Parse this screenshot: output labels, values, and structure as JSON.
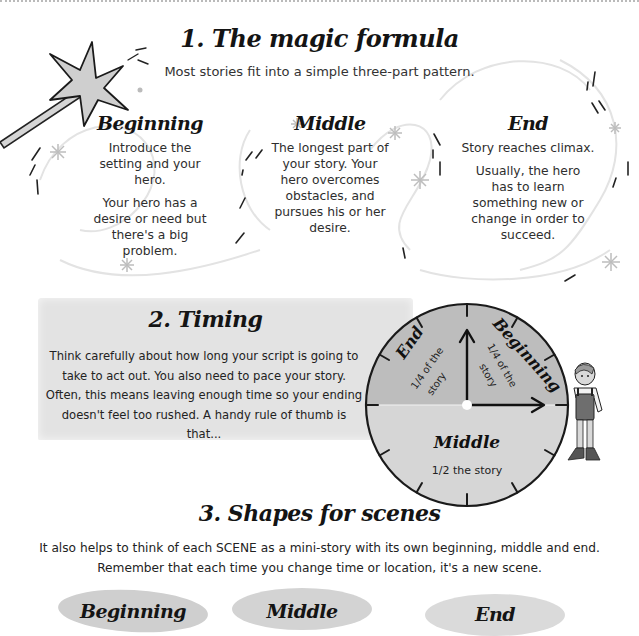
{
  "section1": {
    "title": "1. The magic formula",
    "subtitle": "Most stories fit into a simple three-part pattern.",
    "columns": [
      {
        "title": "Beginning",
        "paragraphs": [
          "Introduce the setting and your hero.",
          "Your hero has a desire or need but there's a big problem."
        ]
      },
      {
        "title": "Middle",
        "paragraphs": [
          "The longest part of your story. Your hero overcomes obstacles, and pursues his or her desire."
        ]
      },
      {
        "title": "End",
        "paragraphs": [
          "Story reaches climax.",
          "Usually, the hero has to learn something new or change in order to succeed."
        ]
      }
    ]
  },
  "section2": {
    "title": "2. Timing",
    "body": "Think carefully about how long your script is going to take to act out. You also need to pace your story. Often, this means leaving enough time so your ending doesn't feel too rushed. A handy rule of thumb is that...",
    "clock": {
      "segments": [
        {
          "label": "Beginning",
          "portion": "1/4 of the story",
          "fraction": 0.25
        },
        {
          "label": "Middle",
          "portion": "1/2 the story",
          "fraction": 0.5
        },
        {
          "label": "End",
          "portion": "1/4 of the story",
          "fraction": 0.25
        }
      ],
      "colors": {
        "quarters": "#bcbcbc",
        "half": "#d6d6d6",
        "outline": "#1a1a1a"
      }
    }
  },
  "section3": {
    "title": "3. Shapes for scenes",
    "body_line1": "It also helps to think of each SCENE as a mini-story with its own beginning, middle and end.",
    "body_line2": "Remember that each time you change time or location, it's a new scene.",
    "shapes": [
      {
        "label": "Beginning"
      },
      {
        "label": "Middle"
      },
      {
        "label": "End"
      }
    ]
  },
  "icons": {
    "wand": "magic-wand-icon",
    "sparkle": "sparkle-icon",
    "clock": "clock-diagram",
    "character": "boy-character-illustration"
  }
}
